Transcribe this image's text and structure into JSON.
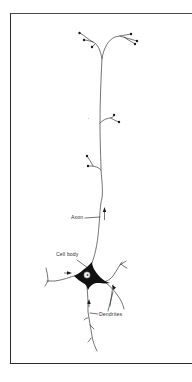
{
  "figure": {
    "labels": {
      "axon": "Axon",
      "cell_body": "Cell body",
      "dendrites": "Dendrites"
    },
    "signal_direction_arrows": [
      {
        "location": "left dendrite",
        "direction": "toward cell body"
      },
      {
        "location": "right dendrite",
        "direction": "toward cell body"
      },
      {
        "location": "lower dendrite",
        "direction": "toward cell body (up)"
      },
      {
        "location": "axon",
        "direction": "away from cell body (up)"
      }
    ],
    "colors": {
      "stroke": "#3a3a3a",
      "soma_fill": "#111111",
      "nucleus_fill": "#f0f0f0",
      "frame": "#2a2a2a",
      "background": "#ffffff"
    }
  }
}
